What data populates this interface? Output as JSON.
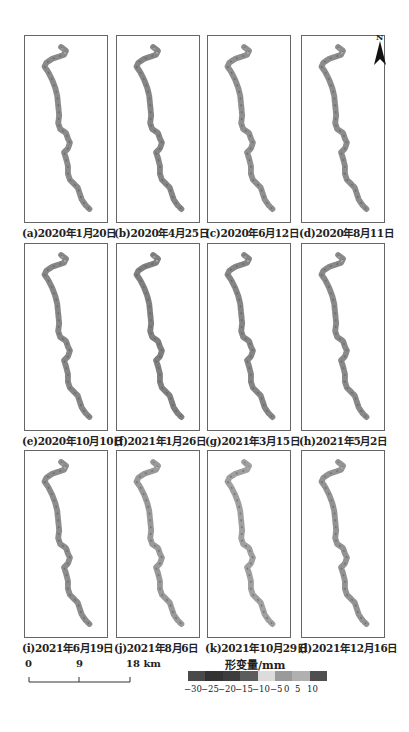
{
  "panels": [
    {
      "label": "(a)2020年1月20日",
      "x": 24,
      "y": 35,
      "tone": "#8a8a8a"
    },
    {
      "label": "(b)2020年4月25日",
      "x": 116,
      "y": 35,
      "tone": "#858585"
    },
    {
      "label": "(c)2020年6月12日",
      "x": 207,
      "y": 35,
      "tone": "#8f8f8f"
    },
    {
      "label": "(d)2020年8月11日",
      "x": 301,
      "y": 35,
      "tone": "#8c8c8c"
    },
    {
      "label": "(e)2020年10月10日",
      "x": 24,
      "y": 243,
      "tone": "#868686"
    },
    {
      "label": "(f)2021年1月26日",
      "x": 116,
      "y": 243,
      "tone": "#7f7f7f"
    },
    {
      "label": "(g)2021年3月15日",
      "x": 207,
      "y": 243,
      "tone": "#858585"
    },
    {
      "label": "(h)2021年5月2日",
      "x": 301,
      "y": 243,
      "tone": "#898989"
    },
    {
      "label": "(i)2021年6月19日",
      "x": 24,
      "y": 450,
      "tone": "#8c8c8c"
    },
    {
      "label": "(j)2021年8月6日",
      "x": 116,
      "y": 450,
      "tone": "#999999"
    },
    {
      "label": "(k)2021年10月29日",
      "x": 207,
      "y": 450,
      "tone": "#a0a0a0"
    },
    {
      "label": "(l)2021年12月16日",
      "x": 301,
      "y": 450,
      "tone": "#939393"
    }
  ],
  "north_arrow": {
    "label": "N"
  },
  "scale_bar": {
    "ticks": [
      "0",
      "9",
      "18 km"
    ]
  },
  "legend": {
    "title": "形变量/mm",
    "colors": [
      "#4a4a4a",
      "#333333",
      "#3d3d3d",
      "#5c5c5c",
      "#dcdcdc",
      "#9a9a9a",
      "#b0b0b0",
      "#4f4f4f"
    ],
    "ticks": [
      "−30",
      "−25",
      "−20",
      "−15",
      "−10",
      "−5",
      "0",
      "5",
      "10"
    ]
  }
}
